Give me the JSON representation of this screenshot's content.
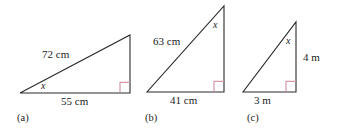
{
  "figure": {
    "background_color": "#ffffff",
    "stroke_color": "#2b2b2b",
    "right_angle_color": "#d49aa8",
    "text_color": "#1a1a1a"
  },
  "triangles": [
    {
      "part_label": "(a)",
      "hypotenuse_label": "72 cm",
      "base_label": "55 cm",
      "vertical_label": "",
      "angle_label": "x",
      "angle_at": "bottom-left",
      "right_angle_at": "bottom-right",
      "geometry": {
        "bottom_left": [
          20,
          93
        ],
        "bottom_right": [
          130,
          93
        ],
        "apex": [
          130,
          35
        ]
      }
    },
    {
      "part_label": "(b)",
      "hypotenuse_label": "63 cm",
      "base_label": "41 cm",
      "vertical_label": "",
      "angle_label": "x",
      "angle_at": "apex",
      "right_angle_at": "bottom-right",
      "geometry": {
        "bottom_left": [
          147,
          92
        ],
        "bottom_right": [
          224,
          92
        ],
        "apex": [
          224,
          6
        ]
      }
    },
    {
      "part_label": "(c)",
      "hypotenuse_label": "",
      "base_label": "3 m",
      "vertical_label": "4 m",
      "angle_label": "x",
      "angle_at": "apex",
      "right_angle_at": "bottom-right",
      "geometry": {
        "bottom_left": [
          243,
          92
        ],
        "bottom_right": [
          296,
          92
        ],
        "apex": [
          296,
          22
        ]
      }
    }
  ],
  "labels": {
    "a_hyp": "72 cm",
    "a_base": "55 cm",
    "a_x": "x",
    "a_part": "(a)",
    "b_hyp": "63 cm",
    "b_base": "41 cm",
    "b_x": "x",
    "b_part": "(b)",
    "c_vert": "4 m",
    "c_base": "3 m",
    "c_x": "x",
    "c_part": "(c)"
  }
}
